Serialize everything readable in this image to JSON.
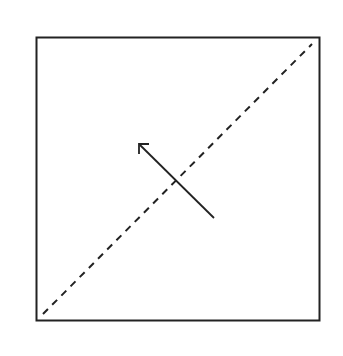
{
  "diagram": {
    "colors": {
      "background": "#ffffff",
      "stroke": "#222222"
    },
    "square": {
      "x": 36,
      "y": 37,
      "width": 284,
      "height": 284
    },
    "diagonal": {
      "x1": 43,
      "y1": 314,
      "x2": 312,
      "y2": 44,
      "style": "dashed"
    },
    "arrow": {
      "x1": 214,
      "y1": 218,
      "x2": 139,
      "y2": 144,
      "direction": "up-left"
    }
  }
}
